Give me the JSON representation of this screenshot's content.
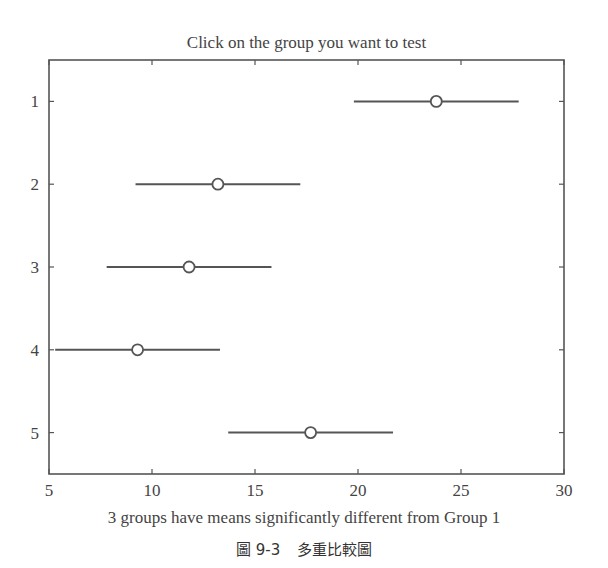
{
  "chart_data": {
    "type": "scatter",
    "subtype": "multiple-comparison-intervals",
    "title": "Click on the group you want to test",
    "xlabel": "3 groups have means significantly different from Group 1",
    "ylabel": "",
    "xlim": [
      5,
      30
    ],
    "ylim": [
      0.5,
      5.5
    ],
    "y_reversed": true,
    "x_ticks": [
      5,
      10,
      15,
      20,
      25,
      30
    ],
    "y_ticks": [
      1,
      2,
      3,
      4,
      5
    ],
    "grid": false,
    "legend": null,
    "groups": [
      {
        "label": "1",
        "mean": 23.8,
        "lower": 19.8,
        "upper": 27.8
      },
      {
        "label": "2",
        "mean": 13.2,
        "lower": 9.2,
        "upper": 17.2
      },
      {
        "label": "3",
        "mean": 11.8,
        "lower": 7.8,
        "upper": 15.8
      },
      {
        "label": "4",
        "mean": 9.3,
        "lower": 5.3,
        "upper": 13.3
      },
      {
        "label": "5",
        "mean": 17.7,
        "lower": 13.7,
        "upper": 21.7
      }
    ],
    "line_color": "#555555",
    "frame_color": "#555555"
  },
  "caption": {
    "figure_label": "圖 9-3",
    "figure_title": "多重比較圖"
  }
}
